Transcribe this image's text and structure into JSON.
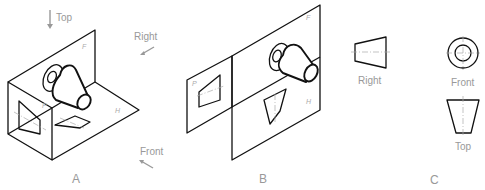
{
  "figure": {
    "panel_a": {
      "label": "A",
      "directions": {
        "top": "Top",
        "right": "Right",
        "front": "Front"
      },
      "plane_labels": {
        "frontal": "F",
        "horizontal": "H",
        "profile": "P"
      }
    },
    "panel_b": {
      "label": "B",
      "plane_labels": {
        "frontal": "F",
        "horizontal": "H",
        "profile": "P"
      }
    },
    "panel_c": {
      "label": "C",
      "view_labels": {
        "right": "Right",
        "front": "Front",
        "top": "Top"
      }
    },
    "colors": {
      "line": "#111111",
      "label": "#999999",
      "centerline": "#aaaaaa"
    }
  }
}
